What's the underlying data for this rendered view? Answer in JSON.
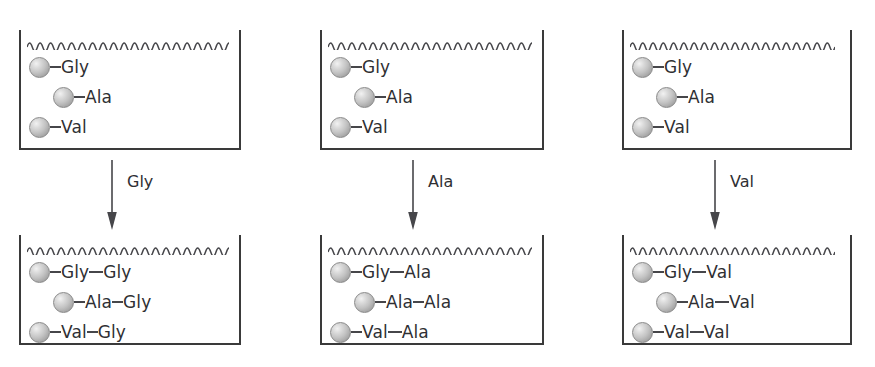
{
  "figure": {
    "type": "solid-phase-peptide-synthesis-diagram",
    "line_color": "#3a3a3a",
    "text_color": "#2f2f33",
    "bead_color": "#c3c3c3",
    "background": "#ffffff",
    "columns": [
      {
        "id": "column-1",
        "top_vessel": {
          "membrane": "wavy-line",
          "rows": [
            {
              "bead": "resin-bead",
              "residues": [
                "Gly"
              ],
              "indent": false
            },
            {
              "bead": "resin-bead",
              "residues": [
                "Ala"
              ],
              "indent": true
            },
            {
              "bead": "resin-bead",
              "residues": [
                "Val"
              ],
              "indent": false
            }
          ]
        },
        "arrow": {
          "label": "Gly",
          "direction": "down"
        },
        "bottom_vessel": {
          "membrane": "wavy-line",
          "rows": [
            {
              "bead": "resin-bead",
              "residues": [
                "Gly",
                "Gly"
              ],
              "indent": false
            },
            {
              "bead": "resin-bead",
              "residues": [
                "Ala",
                "Gly"
              ],
              "indent": true
            },
            {
              "bead": "resin-bead",
              "residues": [
                "Val",
                "Gly"
              ],
              "indent": false
            }
          ]
        }
      },
      {
        "id": "column-2",
        "top_vessel": {
          "membrane": "wavy-line",
          "rows": [
            {
              "bead": "resin-bead",
              "residues": [
                "Gly"
              ],
              "indent": false
            },
            {
              "bead": "resin-bead",
              "residues": [
                "Ala"
              ],
              "indent": true
            },
            {
              "bead": "resin-bead",
              "residues": [
                "Val"
              ],
              "indent": false
            }
          ]
        },
        "arrow": {
          "label": "Ala",
          "direction": "down"
        },
        "bottom_vessel": {
          "membrane": "wavy-line",
          "rows": [
            {
              "bead": "resin-bead",
              "residues": [
                "Gly",
                "Ala"
              ],
              "indent": false
            },
            {
              "bead": "resin-bead",
              "residues": [
                "Ala",
                "Ala"
              ],
              "indent": true
            },
            {
              "bead": "resin-bead",
              "residues": [
                "Val",
                "Ala"
              ],
              "indent": false
            }
          ]
        }
      },
      {
        "id": "column-3",
        "top_vessel": {
          "membrane": "wavy-line",
          "rows": [
            {
              "bead": "resin-bead",
              "residues": [
                "Gly"
              ],
              "indent": false
            },
            {
              "bead": "resin-bead",
              "residues": [
                "Ala"
              ],
              "indent": true
            },
            {
              "bead": "resin-bead",
              "residues": [
                "Val"
              ],
              "indent": false
            }
          ]
        },
        "arrow": {
          "label": "Val",
          "direction": "down"
        },
        "bottom_vessel": {
          "membrane": "wavy-line",
          "rows": [
            {
              "bead": "resin-bead",
              "residues": [
                "Gly",
                "Val"
              ],
              "indent": false
            },
            {
              "bead": "resin-bead",
              "residues": [
                "Ala",
                "Val"
              ],
              "indent": true
            },
            {
              "bead": "resin-bead",
              "residues": [
                "Val",
                "Val"
              ],
              "indent": false
            }
          ]
        }
      }
    ]
  }
}
